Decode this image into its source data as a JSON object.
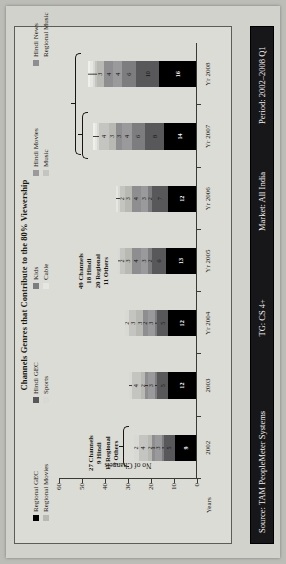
{
  "slide": {
    "title": "Channels Genres that Contribute to the 80% Viewership"
  },
  "legend": [
    {
      "label": "Regional GEC",
      "color": "#000000"
    },
    {
      "label": "Regional Movies",
      "color": "#b9b9b4"
    },
    {
      "label": "Hindi GEC",
      "color": "#58585a"
    },
    {
      "label": "Sports",
      "color": "#d8d8d4"
    },
    {
      "label": "Kids",
      "color": "#7d7d7f"
    },
    {
      "label": "Cable",
      "color": "#e6e6e2"
    },
    {
      "label": "Hindi Movies",
      "color": "#9a9a9c"
    },
    {
      "label": "Music",
      "color": "#c4c4c0"
    },
    {
      "label": "Hindi News",
      "color": "#8e8e90"
    },
    {
      "label": "Regional Music",
      "color": "#efefeb"
    }
  ],
  "axes": {
    "y_title": "No of Channels",
    "x_title": "Years",
    "y_ticks": [
      "0",
      "10",
      "20",
      "30",
      "40",
      "50",
      "60"
    ]
  },
  "callouts": [
    {
      "lines": "27 Channels\n9 Hindi\n11 Regional\n7 Others"
    },
    {
      "lines": "49 Channels\n18 Hindi\n20 Regional\n11 Others"
    }
  ],
  "footer": {
    "source": "Source: TAM PeopleMeter Systems",
    "tg": "TG: CS 4+",
    "market": "Market: All India",
    "period": "Period: 2002–2008 Q1"
  },
  "chart_data": {
    "type": "bar",
    "title": "Channels Genres that Contribute to the 80% Viewership",
    "xlabel": "Years",
    "ylabel": "No of Channels",
    "ylim": [
      0,
      60
    ],
    "stacked": true,
    "grid": false,
    "legend_position": "top",
    "categories": [
      "2002",
      "2003",
      "Yr 2004",
      "Yr 2005",
      "Yr 2006",
      "Yr 2007",
      "Yr 2008"
    ],
    "series": [
      {
        "name": "Regional GEC",
        "color": "#000000",
        "values": [
          9,
          12,
          12,
          13,
          12,
          14,
          16
        ]
      },
      {
        "name": "Hindi GEC",
        "color": "#58585a",
        "values": [
          5,
          5,
          5,
          6,
          7,
          8,
          10
        ]
      },
      {
        "name": "Kids",
        "color": "#7d7d7f",
        "values": [
          1,
          1,
          1,
          2,
          2,
          6,
          6
        ]
      },
      {
        "name": "Hindi Movies",
        "color": "#9a9a9c",
        "values": [
          3,
          3,
          3,
          3,
          3,
          4,
          4
        ]
      },
      {
        "name": "Hindi News",
        "color": "#8e8e90",
        "values": [
          1,
          1,
          2,
          4,
          4,
          3,
          4
        ]
      },
      {
        "name": "Regional Movies",
        "color": "#b9b9b4",
        "values": [
          2,
          2,
          3,
          3,
          3,
          3,
          3
        ]
      },
      {
        "name": "Music",
        "color": "#c4c4c0",
        "values": [
          4,
          4,
          3,
          2,
          2,
          4,
          1
        ]
      },
      {
        "name": "Sports",
        "color": "#d8d8d4",
        "values": [
          2,
          1,
          2,
          1,
          1,
          1,
          1
        ]
      },
      {
        "name": "Cable",
        "color": "#e6e6e2",
        "values": [
          0,
          0,
          0,
          0,
          1,
          1,
          1
        ]
      },
      {
        "name": "Regional Music",
        "color": "#efefeb",
        "values": [
          0,
          0,
          0,
          0,
          0,
          1,
          1
        ]
      }
    ],
    "totals": [
      27,
      29,
      32,
      34,
      35,
      45,
      47
    ]
  }
}
